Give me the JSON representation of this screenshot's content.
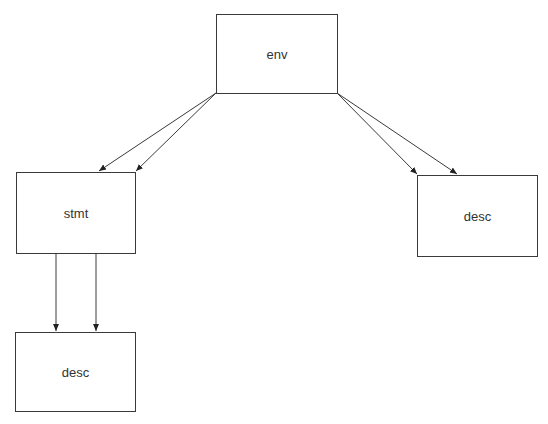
{
  "diagram": {
    "type": "directed-graph",
    "colors": {
      "background": "#ffffff",
      "node_border": "#3a3a3a",
      "edge": "#3a3a3a",
      "text": "#333333"
    },
    "nodes": [
      {
        "id": "env",
        "label": "env"
      },
      {
        "id": "stmt",
        "label": "stmt"
      },
      {
        "id": "desc1",
        "label": "desc"
      },
      {
        "id": "desc2",
        "label": "desc"
      }
    ],
    "edges": [
      {
        "from": "env",
        "to": "stmt"
      },
      {
        "from": "env",
        "to": "stmt"
      },
      {
        "from": "env",
        "to": "desc2"
      },
      {
        "from": "env",
        "to": "desc2"
      },
      {
        "from": "stmt",
        "to": "desc1"
      },
      {
        "from": "stmt",
        "to": "desc1"
      }
    ]
  }
}
